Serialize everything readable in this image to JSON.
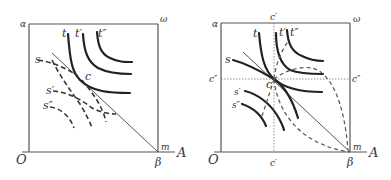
{
  "figure": {
    "panels": [
      {
        "id": "left",
        "corner_labels": {
          "top_left": "α",
          "top_right": "ω",
          "bottom_left": "O",
          "bottom_right_below": "β",
          "bottom_right_inside": "m",
          "axis_end": "A"
        },
        "indifference_labels_solid": [
          "t",
          "t′",
          "t″"
        ],
        "indifference_labels_dashed": [
          "s",
          "s′",
          "s″"
        ],
        "point_label": "c"
      },
      {
        "id": "right",
        "corner_labels": {
          "top_left": "α",
          "top_right": "ω",
          "bottom_left": "O",
          "bottom_right_below": "β",
          "bottom_right_inside": "m",
          "axis_end": "A"
        },
        "indifference_labels_solid": [
          "t",
          "t′",
          "t″"
        ],
        "indifference_labels_dashed": [
          "s",
          "s′",
          "s″"
        ],
        "point_label": "c",
        "guide_labels": {
          "top": "c′",
          "bottom": "c′",
          "left": "c″",
          "right": "c″"
        }
      }
    ]
  }
}
